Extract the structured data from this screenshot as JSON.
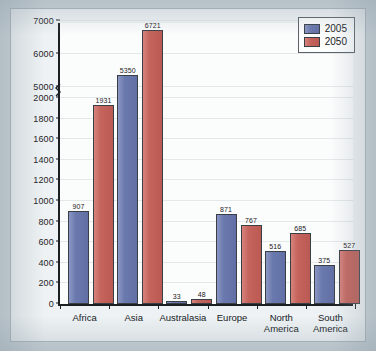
{
  "chart_data": {
    "type": "bar",
    "title": "",
    "xlabel": "",
    "ylabel": "Population (in millions)",
    "categories": [
      "Africa",
      "Asia",
      "Australasia",
      "Europe",
      "North\nAmerica",
      "South\nAmerica"
    ],
    "series": [
      {
        "name": "2005",
        "color": "#6a79ad",
        "values": [
          907,
          5350,
          33,
          871,
          516,
          375
        ]
      },
      {
        "name": "2050",
        "color": "#c4645c",
        "values": [
          1931,
          6721,
          48,
          767,
          685,
          527
        ]
      }
    ],
    "ylim": [
      0,
      7000
    ],
    "y_ticks": [
      0,
      200,
      400,
      600,
      800,
      1000,
      1200,
      1400,
      1600,
      1800,
      2000,
      5000,
      6000,
      7000
    ],
    "axis_break": {
      "present": true,
      "below": 2000,
      "above": 5000
    },
    "grid": true,
    "legend_position": "top-right",
    "value_labels": true
  },
  "legend": {
    "entries": [
      {
        "label": "2005"
      },
      {
        "label": "2050"
      }
    ]
  },
  "axis": {
    "y_title": "Population (in millions)"
  }
}
